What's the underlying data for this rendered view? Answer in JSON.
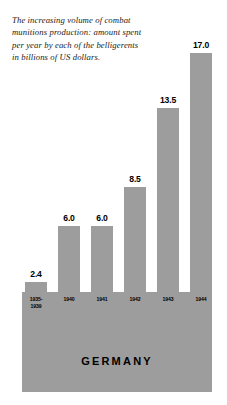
{
  "caption": "The increasing volume of combat munitions production: amount spent per year by each of the belligerents in billions of US dollars.",
  "country": "GERMANY",
  "colors": {
    "bar": "#9d9d9d",
    "panel": "#9d9d9d",
    "background": "#ffffff",
    "text": "#000000"
  },
  "chart_data": {
    "type": "bar",
    "title": "GERMANY",
    "subtitle": "The increasing volume of combat munitions production: amount spent per year by each of the belligerents in billions of US dollars.",
    "categories": [
      "1935-\n1939",
      "1940",
      "1941",
      "1942",
      "1943",
      "1944"
    ],
    "values": [
      2.4,
      6.0,
      6.0,
      8.5,
      13.5,
      17.0
    ],
    "value_labels": [
      "2.4",
      "6.0",
      "6.0",
      "8.5",
      "13.5",
      "17.0"
    ],
    "xlabel": "",
    "ylabel": "billions of US dollars",
    "ylim": [
      0,
      17.0
    ],
    "grid": false,
    "legend": false,
    "bars": [
      {
        "label_line1": "1935-",
        "label_line2": "1939",
        "value": 2.4,
        "value_label": "2.4"
      },
      {
        "label_line1": "1940",
        "label_line2": "",
        "value": 6.0,
        "value_label": "6.0"
      },
      {
        "label_line1": "1941",
        "label_line2": "",
        "value": 6.0,
        "value_label": "6.0"
      },
      {
        "label_line1": "1942",
        "label_line2": "",
        "value": 8.5,
        "value_label": "8.5"
      },
      {
        "label_line1": "1943",
        "label_line2": "",
        "value": 13.5,
        "value_label": "13.5"
      },
      {
        "label_line1": "1944",
        "label_line2": "",
        "value": 17.0,
        "value_label": "17.0"
      }
    ]
  }
}
